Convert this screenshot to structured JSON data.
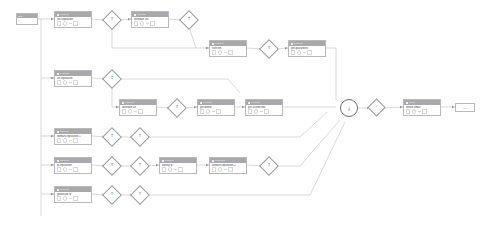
{
  "canvas": {
    "background_color": "#ffffff",
    "grid_color": "#e3e3e6",
    "edge_color": "#c8c8cd",
    "node_header_color": "#a8a8ad",
    "node_border_color": "#b9b9bd",
    "node_title_color": "#3a3a40"
  },
  "start_node": {
    "label": "start",
    "sub": "id"
  },
  "end_node": {
    "label": "end"
  },
  "merge_node": {
    "glyph": "⤓",
    "name": "merge-join"
  },
  "nodes": [
    {
      "id": "n1",
      "header": "webhook",
      "title": "file-reputation",
      "sub": "",
      "x": 54,
      "y": 11,
      "w": 38,
      "h": 17
    },
    {
      "id": "n2",
      "header": "webhook",
      "title": "detonate file",
      "sub": "",
      "x": 131,
      "y": 11,
      "w": 38,
      "h": 17
    },
    {
      "id": "n3",
      "header": "webhook",
      "title": "hunt file",
      "sub": "",
      "x": 209,
      "y": 40,
      "w": 38,
      "h": 17
    },
    {
      "id": "n4",
      "header": "webhook",
      "title": "get quarantine",
      "sub": "",
      "x": 288,
      "y": 40,
      "w": 38,
      "h": 17
    },
    {
      "id": "n5",
      "header": "webhook",
      "title": "url-reputation",
      "sub": "",
      "x": 54,
      "y": 70,
      "w": 38,
      "h": 17
    },
    {
      "id": "n6",
      "header": "webhook",
      "title": "detonate url",
      "sub": "",
      "x": 119,
      "y": 99,
      "w": 38,
      "h": 17
    },
    {
      "id": "n7",
      "header": "webhook",
      "title": "get button",
      "sub": "",
      "x": 197,
      "y": 99,
      "w": 38,
      "h": 17
    },
    {
      "id": "n8",
      "header": "webhook",
      "title": "get screenshot",
      "sub": "",
      "x": 245,
      "y": 99,
      "w": 38,
      "h": 17
    },
    {
      "id": "n9",
      "header": "webhook",
      "title": "domain-reputation-1",
      "sub": "",
      "x": 54,
      "y": 128,
      "w": 38,
      "h": 17
    },
    {
      "id": "n10",
      "header": "webhook",
      "title": "ip-reputation",
      "sub": "",
      "x": 54,
      "y": 157,
      "w": 38,
      "h": 17
    },
    {
      "id": "n11",
      "header": "webhook",
      "title": "lookup ip",
      "sub": "",
      "x": 159,
      "y": 157,
      "w": 38,
      "h": 17
    },
    {
      "id": "n12",
      "header": "webhook2",
      "title": "domain-reputation-2",
      "sub": "",
      "x": 209,
      "y": 157,
      "w": 38,
      "h": 17
    },
    {
      "id": "n13",
      "header": "webhook",
      "title": "geolocate ip",
      "sub": "",
      "x": 54,
      "y": 186,
      "w": 38,
      "h": 17
    },
    {
      "id": "n14",
      "header": "output",
      "title": "delete email",
      "sub": "",
      "x": 403,
      "y": 99,
      "w": 38,
      "h": 17
    }
  ],
  "gateways": [
    {
      "id": "g1",
      "glyph": "T",
      "x": 105,
      "y": 13,
      "s": 14
    },
    {
      "id": "g2",
      "glyph": "T",
      "x": 182,
      "y": 13,
      "s": 14
    },
    {
      "id": "g3",
      "glyph": "T",
      "x": 262,
      "y": 42,
      "s": 14
    },
    {
      "id": "g4",
      "glyph": "T",
      "x": 105,
      "y": 72,
      "s": 14
    },
    {
      "id": "g5",
      "glyph": "T",
      "x": 170,
      "y": 101,
      "s": 14
    },
    {
      "id": "g6",
      "glyph": "T",
      "x": 105,
      "y": 130,
      "s": 14
    },
    {
      "id": "g7",
      "glyph": "T",
      "x": 133,
      "y": 130,
      "s": 14
    },
    {
      "id": "g8",
      "glyph": "T",
      "x": 105,
      "y": 159,
      "s": 14
    },
    {
      "id": "g9",
      "glyph": "T",
      "x": 133,
      "y": 159,
      "s": 14
    },
    {
      "id": "g10",
      "glyph": "T",
      "x": 262,
      "y": 159,
      "s": 14
    },
    {
      "id": "g11",
      "glyph": "T",
      "x": 105,
      "y": 188,
      "s": 14
    },
    {
      "id": "g12",
      "glyph": "T",
      "x": 133,
      "y": 188,
      "s": 14
    },
    {
      "id": "g13",
      "glyph": "<",
      "x": 370,
      "y": 101,
      "s": 13
    }
  ],
  "merge": {
    "x": 340,
    "y": 99,
    "d": 18
  },
  "start": {
    "x": 16,
    "y": 13,
    "w": 22,
    "h": 12
  },
  "end": {
    "x": 455,
    "y": 103,
    "w": 20,
    "h": 9
  },
  "icon_row": [
    "square-icon",
    "circle-icon",
    "line-icon",
    "square-icon"
  ]
}
